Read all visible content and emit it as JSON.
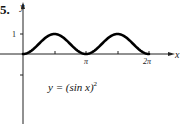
{
  "problem_number": "5.",
  "chart_data": {
    "type": "line",
    "title": "",
    "equation": "y = (sin x)^2",
    "xlabel": "x",
    "ylabel": "y",
    "x_ticks": [
      "π/2",
      "π",
      "3π/2",
      "2π"
    ],
    "x_tick_labels": [
      "",
      "π",
      "",
      "2π"
    ],
    "y_ticks": [
      1,
      -1
    ],
    "y_tick_labels": [
      "1",
      ""
    ],
    "x": [
      0,
      0.785,
      1.571,
      2.356,
      3.142,
      3.927,
      4.712,
      5.498,
      6.283
    ],
    "values": [
      0,
      0.5,
      1,
      0.5,
      0,
      0.5,
      1,
      0.5,
      0
    ],
    "xlim": [
      0,
      6.283
    ],
    "ylim": [
      -2,
      1.5
    ],
    "grid": false
  },
  "labels": {
    "y_axis": "y",
    "x_axis": "x",
    "one": "1",
    "pi": "π",
    "two_pi": "2π",
    "equation_lhs": "y = (sin x)",
    "equation_exp": "2"
  }
}
